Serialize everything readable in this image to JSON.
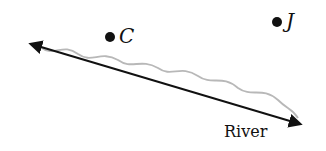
{
  "diagram": {
    "points": [
      {
        "label": "C",
        "x": 110,
        "y": 37
      },
      {
        "label": "J",
        "x": 277,
        "y": 22
      }
    ],
    "line": {
      "label": "River",
      "start": [
        29,
        43
      ],
      "end": [
        302,
        125
      ],
      "arrows": "both"
    },
    "colors": {
      "line": "#111111",
      "river": "#b8b8b8",
      "point": "#111111"
    }
  }
}
